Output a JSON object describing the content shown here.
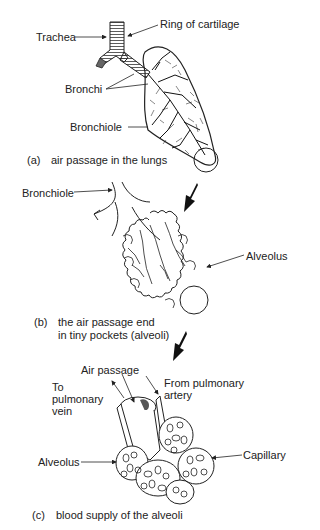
{
  "panels": [
    {
      "id": "a",
      "caption_tag": "(a)",
      "caption": "air passage in the lungs",
      "labels": {
        "trachea": "Trachea",
        "ring": "Ring of cartilage",
        "bronchi": "Bronchi",
        "bronchiole": "Bronchiole"
      }
    },
    {
      "id": "b",
      "caption_tag": "(b)",
      "caption_line1": "the air passage end",
      "caption_line2": "in tiny pockets (alveoli)",
      "labels": {
        "bronchiole": "Bronchiole",
        "alveolus": "Alveolus"
      }
    },
    {
      "id": "c",
      "caption_tag": "(c)",
      "caption": "blood supply of the alveoli",
      "labels": {
        "air_passage": "Air passage",
        "to_vein_1": "To",
        "to_vein_2": "pulmonary",
        "to_vein_3": "vein",
        "from_artery_1": "From pulmonary",
        "from_artery_2": "artery",
        "alveolus": "Alveolus",
        "capillary": "Capillary"
      }
    }
  ],
  "colors": {
    "ink": "#1a1a1a",
    "background": "#ffffff"
  }
}
